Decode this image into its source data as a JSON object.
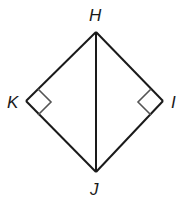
{
  "diagram": {
    "title": "",
    "vertices": [
      {
        "id": "H",
        "label": "H",
        "x": 96,
        "y": 32
      },
      {
        "id": "K",
        "label": "K",
        "x": 26,
        "y": 101
      },
      {
        "id": "I",
        "label": "I",
        "x": 163,
        "y": 101
      },
      {
        "id": "J",
        "label": "J",
        "x": 96,
        "y": 172
      }
    ],
    "segments": [
      [
        "H",
        "K"
      ],
      [
        "K",
        "J"
      ],
      [
        "H",
        "I"
      ],
      [
        "I",
        "J"
      ],
      [
        "H",
        "J"
      ]
    ],
    "right_angles": [
      "K",
      "I"
    ],
    "colors": {
      "stroke": "#1a1a1a",
      "marker": "#555555",
      "background": "#ffffff"
    }
  }
}
